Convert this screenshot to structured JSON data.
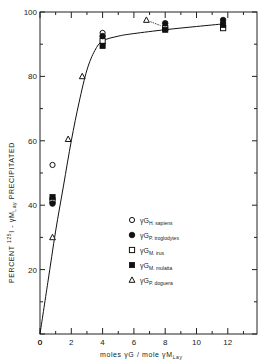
{
  "chart_data": {
    "type": "scatter",
    "title": "",
    "xlabel": "moles γG / mole γM_Lay",
    "ylabel": "PERCENT 125I - γM_Lay PRECIPITATED",
    "xlim": [
      0,
      14
    ],
    "ylim": [
      0,
      100
    ],
    "xticks": [
      0,
      2,
      4,
      6,
      8,
      10,
      12
    ],
    "yticks": [
      0,
      20,
      40,
      60,
      80,
      100
    ],
    "grid": false,
    "legend_position": "lower-right (inside)",
    "series": [
      {
        "name": "γG H. sapiens",
        "marker": "open-circle",
        "points": [
          [
            0.8,
            52.5
          ],
          [
            4,
            93.5
          ]
        ]
      },
      {
        "name": "γG P. troglodytes",
        "marker": "filled-circle",
        "points": [
          [
            0.8,
            40.5
          ],
          [
            4,
            92.5
          ],
          [
            8,
            96.5
          ],
          [
            11.7,
            97.5
          ]
        ]
      },
      {
        "name": "γG M. irus",
        "marker": "open-square",
        "points": [
          [
            0.8,
            41.5
          ],
          [
            4,
            91
          ],
          [
            8,
            95
          ],
          [
            11.7,
            95
          ]
        ]
      },
      {
        "name": "γG M. mulatta",
        "marker": "filled-square",
        "points": [
          [
            0.8,
            42.5
          ],
          [
            4,
            89.5
          ],
          [
            8,
            94.5
          ],
          [
            11.7,
            96
          ]
        ]
      },
      {
        "name": "γG P. doguera",
        "marker": "open-triangle",
        "points": [
          [
            0.8,
            30
          ],
          [
            1.8,
            60.5
          ],
          [
            2.7,
            80
          ],
          [
            6.8,
            97.5
          ]
        ]
      }
    ],
    "fit_curve": {
      "description": "smooth saturation curve from origin",
      "points": [
        [
          0,
          0
        ],
        [
          0.5,
          16
        ],
        [
          1,
          32
        ],
        [
          1.5,
          46
        ],
        [
          2,
          60
        ],
        [
          2.5,
          72
        ],
        [
          3,
          82
        ],
        [
          3.5,
          88
        ],
        [
          4,
          91
        ],
        [
          5,
          92.5
        ],
        [
          6,
          93.3
        ],
        [
          8,
          94.5
        ],
        [
          10,
          95.5
        ],
        [
          11.7,
          96.3
        ]
      ]
    }
  },
  "labels": {
    "x_ticks": [
      "0",
      "2",
      "4",
      "6",
      "8",
      "10",
      "12"
    ],
    "y_ticks": [
      "0",
      "20",
      "40",
      "60",
      "80",
      "100"
    ],
    "x_axis_main": "moles  γG / mole γM",
    "x_axis_sub": "Lay",
    "y_axis_main_1": "PERCENT ",
    "y_axis_sup": "125",
    "y_axis_main_2": "I - γM",
    "y_axis_sub": "Lay",
    "y_axis_main_3": "  PRECIPITATED"
  },
  "legend": [
    {
      "marker": "open-circle",
      "prefix": "γG",
      "sub": "H. sapiens"
    },
    {
      "marker": "filled-circle",
      "prefix": "γG",
      "sub": "P. troglodytes"
    },
    {
      "marker": "open-square",
      "prefix": "γG",
      "sub": "M. irus"
    },
    {
      "marker": "filled-square",
      "prefix": "γG",
      "sub": "M. mulatta"
    },
    {
      "marker": "open-triangle",
      "prefix": "γG",
      "sub": "P. doguera"
    }
  ]
}
